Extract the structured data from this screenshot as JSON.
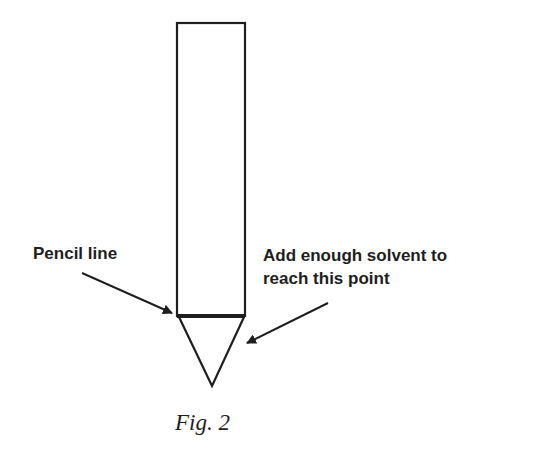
{
  "figure": {
    "caption": "Fig. 2",
    "labels": {
      "pencil_line": "Pencil line",
      "solvent_line1": "Add enough solvent to",
      "solvent_line2": "reach this point"
    },
    "colors": {
      "stroke": "#1e1e1e",
      "background": "#ffffff"
    }
  }
}
